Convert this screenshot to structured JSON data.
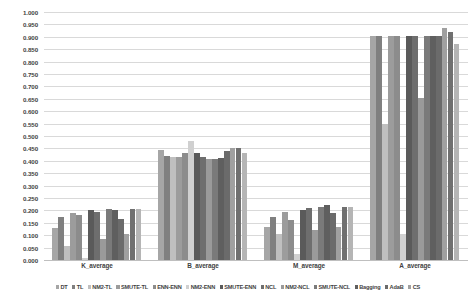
{
  "chart_data": {
    "type": "bar",
    "title": "",
    "subtitle": "",
    "xlabel": "",
    "ylabel": "",
    "ylim": [
      0.0,
      1.0
    ],
    "ytick_step": 0.05,
    "grid": true,
    "legend_position": "bottom",
    "categories": [
      "K_average",
      "B_average",
      "M_average",
      "A_average"
    ],
    "ytick_labels": [
      "1.000",
      "0.950",
      "0.900",
      "0.850",
      "0.800",
      "0.750",
      "0.700",
      "0.650",
      "0.600",
      "0.550",
      "0.500",
      "0.450",
      "0.400",
      "0.350",
      "0.300",
      "0.250",
      "0.200",
      "0.150",
      "0.100",
      "0.050",
      "0.000"
    ],
    "ytick_values": [
      1.0,
      0.95,
      0.9,
      0.85,
      0.8,
      0.75,
      0.7,
      0.65,
      0.6,
      0.55,
      0.5,
      0.45,
      0.4,
      0.35,
      0.3,
      0.25,
      0.2,
      0.15,
      0.1,
      0.05,
      0.0
    ],
    "series": [
      {
        "name": "DT",
        "color": "#a6a6a6",
        "values": [
          0.13,
          0.445,
          0.135,
          0.905
        ]
      },
      {
        "name": "TL",
        "color": "#808080",
        "values": [
          0.175,
          0.42,
          0.175,
          0.905
        ]
      },
      {
        "name": "NM2-TL",
        "color": "#bfbfbf",
        "values": [
          0.055,
          0.415,
          0.105,
          0.55
        ]
      },
      {
        "name": "SMUTE-TL",
        "color": "#9c9c9c",
        "values": [
          0.19,
          0.415,
          0.195,
          0.905
        ]
      },
      {
        "name": "ENN-ENN",
        "color": "#8c8c8c",
        "values": [
          0.18,
          0.43,
          0.16,
          0.905
        ]
      },
      {
        "name": "NM2-ENN",
        "color": "#d0d0d0",
        "values": [
          0.01,
          0.48,
          0.025,
          0.105
        ]
      },
      {
        "name": "SMUTE-ENN",
        "color": "#5a5a5a",
        "values": [
          0.2,
          0.43,
          0.2,
          0.905
        ]
      },
      {
        "name": "NCL",
        "color": "#6e6e6e",
        "values": [
          0.195,
          0.415,
          0.21,
          0.905
        ]
      },
      {
        "name": "NM2-NCL",
        "color": "#9a9a9a",
        "values": [
          0.085,
          0.408,
          0.12,
          0.655
        ]
      },
      {
        "name": "SMUTE-NCL",
        "color": "#7a7a7a",
        "values": [
          0.205,
          0.408,
          0.215,
          0.905
        ]
      },
      {
        "name": "Bagging",
        "color": "#5f5f5f",
        "values": [
          0.2,
          0.412,
          0.22,
          0.905
        ]
      },
      {
        "name": "AdaB",
        "color": "#6b6b6b",
        "values": [
          0.165,
          0.44,
          0.19,
          0.905
        ]
      },
      {
        "name": "CS",
        "color": "#a0a0a0",
        "values": [
          0.105,
          0.45,
          0.135,
          0.935
        ]
      },
      {
        "name": "CS2",
        "color": "#707070",
        "values": [
          0.205,
          0.45,
          0.215,
          0.92
        ]
      },
      {
        "name": "CS3",
        "color": "#b5b5b5",
        "values": [
          0.205,
          0.43,
          0.215,
          0.87
        ]
      }
    ]
  },
  "legend": {
    "items": [
      {
        "label": "DT"
      },
      {
        "label": "TL"
      },
      {
        "label": "NM2-TL"
      },
      {
        "label": "SMUTE-TL"
      },
      {
        "label": "ENN-ENN"
      },
      {
        "label": "NM2-ENN"
      },
      {
        "label": "SMUTE-ENN"
      },
      {
        "label": "NCL"
      },
      {
        "label": "NM2-NCL"
      },
      {
        "label": "SMUTE-NCL"
      },
      {
        "label": "Bagging"
      },
      {
        "label": "AdaB"
      },
      {
        "label": "CS"
      }
    ]
  },
  "colors": {
    "gridline": "#d9d9d9",
    "text": "#3f3f3f",
    "background": "#ffffff"
  }
}
